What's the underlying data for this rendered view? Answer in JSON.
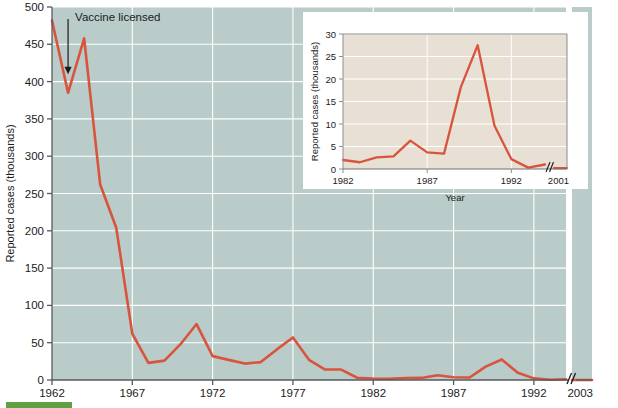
{
  "figure": {
    "background_color": "#ffffff",
    "plot_bg_color": "#b9ccca",
    "inset_bg_color": "#e8e0d4",
    "line_color": "#d9543c",
    "grid_color": "#ffffff",
    "axis_color": "#58595b",
    "text_color": "#1b1b1b",
    "accent_bar_color": "#5fa043"
  },
  "chart_data": [
    {
      "id": "main",
      "type": "line",
      "title": "",
      "xlabel": "",
      "ylabel": "Reported cases (thousands)",
      "xlim": [
        1962,
        1994
      ],
      "ylim": [
        0,
        500
      ],
      "xticks": [
        1962,
        1967,
        1972,
        1977,
        1982,
        1987,
        1992
      ],
      "xtick_labels": [
        "1962",
        "1967",
        "1972",
        "1977",
        "1982",
        "1987",
        "1992"
      ],
      "yticks": [
        0,
        50,
        100,
        150,
        200,
        250,
        300,
        350,
        400,
        450,
        500
      ],
      "ytick_labels": [
        "0",
        "50",
        "100",
        "150",
        "200",
        "250",
        "300",
        "350",
        "400",
        "450",
        "500"
      ],
      "grid": true,
      "axis_break": true,
      "axis_break_label": "2003",
      "x": [
        1962,
        1963,
        1964,
        1965,
        1966,
        1967,
        1968,
        1969,
        1970,
        1971,
        1972,
        1973,
        1974,
        1975,
        1976,
        1977,
        1978,
        1979,
        1980,
        1981,
        1982,
        1983,
        1984,
        1985,
        1986,
        1987,
        1988,
        1989,
        1990,
        1991,
        1992,
        1993,
        1994,
        2003
      ],
      "values": [
        482,
        385,
        458,
        262,
        204,
        62,
        23,
        26,
        48,
        75,
        32,
        27,
        22,
        24,
        41,
        57,
        27,
        14,
        14,
        3,
        2,
        1.5,
        2.6,
        2.8,
        6.3,
        3.7,
        3.4,
        18,
        27.5,
        9.6,
        2.2,
        0.3,
        1,
        0.1
      ],
      "annotations": [
        {
          "text": "Vaccine licensed",
          "x": 1963,
          "y": 410,
          "arrow": true
        }
      ]
    },
    {
      "id": "inset",
      "type": "line",
      "title": "",
      "xlabel": "Year",
      "ylabel": "Reported cases (thousands)",
      "xlim": [
        1982,
        1994
      ],
      "ylim": [
        0,
        30
      ],
      "xticks": [
        1982,
        1987,
        1992
      ],
      "xtick_labels": [
        "1982",
        "1987",
        "1992"
      ],
      "yticks": [
        0,
        5,
        10,
        15,
        20,
        25,
        30
      ],
      "ytick_labels": [
        "0",
        "5",
        "10",
        "15",
        "20",
        "25",
        "30"
      ],
      "grid": true,
      "axis_break": true,
      "axis_break_label": "2001",
      "x": [
        1982,
        1983,
        1984,
        1985,
        1986,
        1987,
        1988,
        1989,
        1990,
        1991,
        1992,
        1993,
        1994,
        2001
      ],
      "values": [
        2.0,
        1.5,
        2.6,
        2.8,
        6.3,
        3.7,
        3.4,
        18.2,
        27.5,
        9.6,
        2.2,
        0.3,
        1.0,
        0.2
      ]
    }
  ],
  "caption": {
    "bar_label": "",
    "text": ""
  }
}
